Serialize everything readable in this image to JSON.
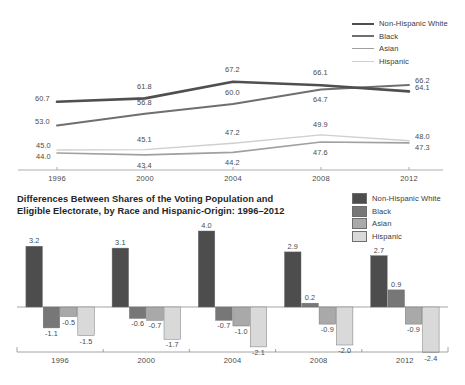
{
  "line_chart": {
    "legend": [
      {
        "label": "Non-Hispanic White",
        "color": "#4f4f4f",
        "width": 2.6
      },
      {
        "label": "Black",
        "color": "#6f6f6f",
        "width": 2.0
      },
      {
        "label": "Asian",
        "color": "#a0a0a0",
        "width": 1.6
      },
      {
        "label": "Hispanic",
        "color": "#cfcfcf",
        "width": 1.4
      }
    ],
    "axis_labels": [
      "1996",
      "2000",
      "2004",
      "2008",
      "2012"
    ]
  },
  "bar_chart": {
    "title": "Differences Between Shares of the Voting Population and Eligible Electorate, by Race and Hispanic-Origin: 1996–2012",
    "legend": [
      {
        "label": "Non-Hispanic White",
        "color": "#4d4d4d"
      },
      {
        "label": "Black",
        "color": "#777777"
      },
      {
        "label": "Asian",
        "color": "#a9a9a9"
      },
      {
        "label": "Hispanic",
        "color": "#d9d9d9"
      }
    ],
    "axis_labels": [
      "1996",
      "2000",
      "2004",
      "2008",
      "2012"
    ]
  },
  "chart_data": [
    {
      "type": "line",
      "title": "",
      "xlabel": "",
      "ylabel": "",
      "x": [
        "1996",
        "2000",
        "2004",
        "2008",
        "2012"
      ],
      "ylim": [
        40,
        70
      ],
      "grid": false,
      "legend_position": "top-right",
      "series": [
        {
          "name": "Non-Hispanic White",
          "color": "#4f4f4f",
          "values": [
            60.7,
            61.8,
            67.2,
            66.1,
            64.1
          ],
          "labels": [
            "60.7",
            "61.8",
            "67.2",
            "66.1",
            "64.1"
          ]
        },
        {
          "name": "Black",
          "color": "#6f6f6f",
          "values": [
            53.0,
            56.8,
            60.0,
            64.7,
            66.2
          ],
          "labels": [
            "53.0",
            "56.8",
            "60.0",
            "64.7",
            "66.2"
          ]
        },
        {
          "name": "Asian",
          "color": "#a0a0a0",
          "values": [
            44.0,
            43.4,
            44.2,
            47.6,
            47.3
          ],
          "labels": [
            "44.0",
            "43.4",
            "44.2",
            "47.6",
            "47.3"
          ]
        },
        {
          "name": "Hispanic",
          "color": "#cfcfcf",
          "values": [
            45.0,
            45.1,
            47.2,
            49.9,
            48.0
          ],
          "labels": [
            "45.0",
            "45.1",
            "47.2",
            "49.9",
            "48.0"
          ]
        }
      ]
    },
    {
      "type": "bar",
      "title": "Differences Between Shares of the Voting Population and Eligible Electorate, by Race and Hispanic-Origin: 1996–2012",
      "xlabel": "",
      "ylabel": "",
      "categories": [
        "1996",
        "2000",
        "2004",
        "2008",
        "2012"
      ],
      "ylim": [
        -3.0,
        4.5
      ],
      "grid": false,
      "legend_position": "top-right",
      "series": [
        {
          "name": "Non-Hispanic White",
          "color": "#4d4d4d",
          "values": [
            3.2,
            3.1,
            4.0,
            2.9,
            2.7
          ],
          "labels": [
            "3.2",
            "3.1",
            "4.0",
            "2.9",
            "2.7"
          ]
        },
        {
          "name": "Black",
          "color": "#777777",
          "values": [
            -1.1,
            -0.6,
            -0.7,
            0.2,
            0.9
          ],
          "labels": [
            "-1.1",
            "-0.6",
            "-0.7",
            "0.2",
            "0.9"
          ]
        },
        {
          "name": "Asian",
          "color": "#a9a9a9",
          "values": [
            -0.5,
            -0.7,
            -1.0,
            -0.9,
            -0.9
          ],
          "labels": [
            "-0.5",
            "-0.7",
            "-1.0",
            "-0.9",
            "-0.9"
          ]
        },
        {
          "name": "Hispanic",
          "color": "#d9d9d9",
          "values": [
            -1.5,
            -1.7,
            -2.1,
            -2.0,
            -2.4
          ],
          "labels": [
            "-1.5",
            "-1.7",
            "-2.1",
            "-2.0",
            "-2.4"
          ]
        }
      ]
    }
  ]
}
